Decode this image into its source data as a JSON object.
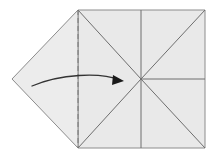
{
  "figure": {
    "caption": "",
    "width": 215,
    "height": 158,
    "background_color": "#ffffff"
  },
  "colors": {
    "paper_fill": "#e9e9e9",
    "paper_fill_light": "#ececec",
    "edge_stroke": "#8c8c8c",
    "crease_stroke": "#6e6e6e",
    "dashed_stroke": "#7a7a7a",
    "arrow_stroke": "#333333",
    "arrowhead_fill": "#1a1a1a"
  },
  "geometry": {
    "square": {
      "left": 78,
      "top": 10,
      "right": 205,
      "bottom": 148
    },
    "center": {
      "x": 141,
      "y": 79
    },
    "flap_tip": {
      "x": 12,
      "y": 79
    },
    "fold_line_x": 78,
    "stroke_widths": {
      "edge": 1.0,
      "crease": 1.0,
      "dashed": 1.0,
      "arrow": 1.3
    },
    "dash_pattern": "5,3"
  },
  "shapes": {
    "right_square": {
      "name": "main-square-panel",
      "points": "78,10 205,10 205,148 78,148"
    },
    "left_flap": {
      "name": "left-triangular-flap",
      "points": "78,10 78,148 12,79"
    }
  },
  "creases": [
    {
      "name": "crease-diagonal-top-left-to-center",
      "x1": 78,
      "y1": 10,
      "x2": 141,
      "y2": 79
    },
    {
      "name": "crease-diagonal-bottom-left-to-center",
      "x1": 78,
      "y1": 148,
      "x2": 141,
      "y2": 79
    },
    {
      "name": "crease-diagonal-top-right-to-center",
      "x1": 205,
      "y1": 10,
      "x2": 141,
      "y2": 79
    },
    {
      "name": "crease-diagonal-bottom-right-to-center",
      "x1": 205,
      "y1": 148,
      "x2": 141,
      "y2": 79
    },
    {
      "name": "crease-vertical-top-half",
      "x1": 141,
      "y1": 10,
      "x2": 141,
      "y2": 79
    },
    {
      "name": "crease-vertical-bottom-half",
      "x1": 141,
      "y1": 79,
      "x2": 141,
      "y2": 148
    },
    {
      "name": "crease-horizontal-right-half",
      "x1": 141,
      "y1": 79,
      "x2": 205,
      "y2": 79
    }
  ],
  "fold_line": {
    "name": "valley-fold-dashed-line",
    "x1": 78,
    "y1": 10,
    "x2": 78,
    "y2": 148,
    "style": "dashed"
  },
  "arrow": {
    "name": "fold-direction-arrow",
    "path": "M 32,86 C 60,74 100,72 120,80",
    "head": {
      "name": "arrowhead",
      "points": "113,75 124,81 112,85",
      "tip_x": 124,
      "tip_y": 81
    }
  },
  "labels": []
}
